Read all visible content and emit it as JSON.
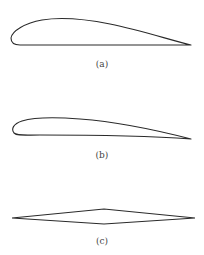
{
  "stroke_color": "#2a2a2a",
  "figures": [
    {
      "id": "a",
      "label": "(a)",
      "description": "Cambered airfoil with thick rounded leading edge and flat bottom"
    },
    {
      "id": "b",
      "label": "(b)",
      "description": "Thinner cambered airfoil with rounded leading edge"
    },
    {
      "id": "c",
      "label": "(c)",
      "description": "Symmetric double-wedge (diamond) supersonic airfoil"
    }
  ]
}
